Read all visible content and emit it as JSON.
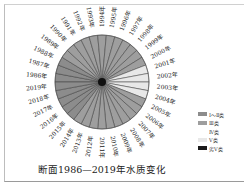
{
  "chart_data": {
    "type": "pie",
    "title": "断面1986—2019年水质变化",
    "categories": [
      "1986年",
      "1987年",
      "1988年",
      "1989年",
      "1990年",
      "1991年",
      "1992年",
      "1993年",
      "1994年",
      "1995年",
      "1996年",
      "1997年",
      "1998年",
      "1999年",
      "2000年",
      "2001年",
      "2002年",
      "2003年",
      "2004年",
      "2005年",
      "2006年",
      "2007年",
      "2008年",
      "2009年",
      "2010年",
      "2011年",
      "2012年",
      "2013年",
      "2014年",
      "2015年",
      "2016年",
      "2017年",
      "2018年",
      "2019年"
    ],
    "values": [
      1,
      1,
      1,
      1,
      1,
      1,
      1,
      1,
      1,
      1,
      1,
      1,
      1,
      1,
      1,
      1,
      1,
      1,
      1,
      1,
      1,
      1,
      1,
      1,
      1,
      1,
      1,
      1,
      1,
      1,
      1,
      1,
      1,
      1
    ],
    "classes": [
      "Ⅰ～Ⅱ类",
      "Ⅰ～Ⅱ类",
      "Ⅰ～Ⅱ类",
      "Ⅲ类",
      "Ⅲ类",
      "Ⅲ类",
      "Ⅲ类",
      "Ⅲ类",
      "Ⅲ类",
      "Ⅲ类",
      "Ⅲ类",
      "Ⅲ类",
      "Ⅲ类",
      "Ⅲ类",
      "Ⅲ类",
      "Ⅴ类",
      "Ⅴ类",
      "Ⅴ类",
      "Ⅴ类",
      "Ⅲ类",
      "Ⅲ类",
      "Ⅲ类",
      "Ⅲ类",
      "Ⅲ类",
      "Ⅲ类",
      "Ⅲ类",
      "Ⅲ类",
      "Ⅲ类",
      "Ⅲ类",
      "Ⅰ～Ⅱ类",
      "Ⅰ～Ⅱ类",
      "Ⅰ～Ⅱ类",
      "Ⅰ～Ⅱ类",
      "Ⅰ～Ⅱ类"
    ],
    "legend": [
      {
        "label": "Ⅰ～Ⅱ类",
        "color": "#8c8c8c"
      },
      {
        "label": "Ⅲ类",
        "color": "#9e9e9e"
      },
      {
        "label": "Ⅳ类",
        "color": "#ffffff"
      },
      {
        "label": "Ⅴ类",
        "color": "#e8e8e8"
      },
      {
        "label": "劣Ⅴ类",
        "color": "#1a1a1a"
      }
    ],
    "legend_position": "right",
    "start_label": "1994年",
    "start_angle_deg": -90
  }
}
